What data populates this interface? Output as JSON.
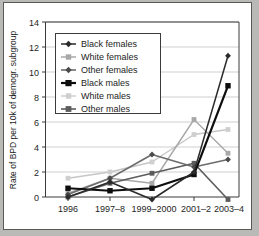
{
  "chart_data": {
    "type": "line",
    "title": "",
    "xlabel": "",
    "ylabel": "Rate of BPD per 10k of demogr. subgroup",
    "categories": [
      "1996",
      "1997–8",
      "1999–2000",
      "2001–2",
      "2003–4"
    ],
    "ylim": [
      -1,
      14
    ],
    "yticks": [
      0,
      2,
      4,
      6,
      8,
      10,
      12,
      14
    ],
    "ytick_labels": [
      "0",
      "2",
      "4",
      "6",
      "8",
      "10",
      "12",
      "14"
    ],
    "grid": "horizontal",
    "legend_position": "upper-left-inside",
    "series": [
      {
        "name": "Black females",
        "color": "#2b2b2b",
        "marker": "diamond",
        "values": [
          0.0,
          1.2,
          -0.2,
          2.0,
          11.3
        ]
      },
      {
        "name": "White females",
        "color": "#a8a8a8",
        "marker": "square",
        "values": [
          0.3,
          1.5,
          1.1,
          6.2,
          3.5
        ]
      },
      {
        "name": "Other females",
        "color": "#6d6d6d",
        "marker": "diamond",
        "values": [
          0.2,
          1.5,
          3.4,
          2.4,
          3.0
        ]
      },
      {
        "name": "Black males",
        "color": "#0d0d0d",
        "marker": "square",
        "values": [
          0.7,
          0.5,
          0.7,
          1.8,
          8.9
        ]
      },
      {
        "name": "White males",
        "color": "#c6c6c6",
        "marker": "square",
        "values": [
          1.5,
          2.0,
          2.8,
          5.0,
          5.4
        ]
      },
      {
        "name": "Other males",
        "color": "#5c5c5c",
        "marker": "square",
        "values": [
          0.0,
          1.1,
          1.9,
          2.7,
          -0.2
        ]
      }
    ]
  },
  "legend": {
    "items": [
      {
        "label": "Black females"
      },
      {
        "label": "White females"
      },
      {
        "label": "Other females"
      },
      {
        "label": "Black males"
      },
      {
        "label": "White males"
      },
      {
        "label": "Other males"
      }
    ]
  },
  "colors": {
    "page_background": "#b9b9b7",
    "plot_background": "#ffffff",
    "axis": "#3b3b3b",
    "grid": "#c3c3c3"
  }
}
